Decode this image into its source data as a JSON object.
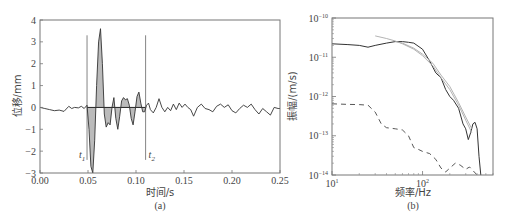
{
  "chart_data": [
    {
      "type": "line",
      "panel_label": "(a)",
      "title": "",
      "xlabel": "时间/s",
      "ylabel": "位移/mm",
      "xlim": [
        0.0,
        0.25
      ],
      "ylim": [
        -3,
        4
      ],
      "xticks": [
        "0.00",
        "0.05",
        "0.10",
        "0.15",
        "0.20",
        "0.25"
      ],
      "yticks": [
        "4",
        "3",
        "2",
        "1",
        "0",
        "-1",
        "-2",
        "-3"
      ],
      "grid": false,
      "annotations": [
        {
          "text": "t1",
          "x": 0.049,
          "y": -2.3
        },
        {
          "text": "t2",
          "x": 0.11,
          "y": -2.3
        }
      ],
      "markers": [
        {
          "name": "t1",
          "x": 0.049,
          "y_from": -2.4,
          "y_to": 3.3
        },
        {
          "name": "t2",
          "x": 0.11,
          "y_from": -2.4,
          "y_to": 3.3
        }
      ],
      "shaded_window": [
        0.049,
        0.11
      ],
      "series": [
        {
          "name": "displacement",
          "x": [
            0.0,
            0.005,
            0.01,
            0.015,
            0.02,
            0.025,
            0.03,
            0.033,
            0.036,
            0.04,
            0.043,
            0.046,
            0.049,
            0.051,
            0.053,
            0.055,
            0.057,
            0.059,
            0.061,
            0.063,
            0.065,
            0.067,
            0.069,
            0.071,
            0.073,
            0.075,
            0.077,
            0.079,
            0.081,
            0.083,
            0.085,
            0.087,
            0.089,
            0.091,
            0.093,
            0.095,
            0.097,
            0.099,
            0.101,
            0.103,
            0.105,
            0.107,
            0.109,
            0.111,
            0.113,
            0.115,
            0.118,
            0.121,
            0.124,
            0.127,
            0.13,
            0.133,
            0.136,
            0.139,
            0.142,
            0.145,
            0.148,
            0.151,
            0.154,
            0.157,
            0.16,
            0.164,
            0.168,
            0.172,
            0.176,
            0.18,
            0.184,
            0.188,
            0.192,
            0.196,
            0.2,
            0.204,
            0.208,
            0.212,
            0.216,
            0.22,
            0.224,
            0.228,
            0.232,
            0.236,
            0.24,
            0.244,
            0.248,
            0.25
          ],
          "y": [
            0.0,
            -0.05,
            -0.1,
            -0.15,
            -0.12,
            -0.18,
            0.05,
            -0.05,
            0.0,
            -0.02,
            0.05,
            -0.05,
            0.1,
            -1.0,
            -2.7,
            -3.0,
            -1.5,
            1.0,
            3.0,
            3.6,
            2.0,
            -0.3,
            -0.9,
            -0.7,
            -0.8,
            0.0,
            0.45,
            -0.5,
            -1.0,
            -0.4,
            0.3,
            0.45,
            0.35,
            0.4,
            0.1,
            -0.5,
            -0.8,
            -0.2,
            0.5,
            0.7,
            0.2,
            -0.2,
            -0.2,
            0.1,
            0.2,
            -0.1,
            -0.25,
            0.0,
            0.4,
            0.0,
            -0.2,
            0.0,
            -0.15,
            0.15,
            -0.1,
            0.2,
            0.0,
            0.15,
            0.0,
            -0.1,
            -0.4,
            0.0,
            0.15,
            -0.05,
            -0.1,
            -0.2,
            0.05,
            0.15,
            0.0,
            0.12,
            -0.15,
            -0.25,
            -0.05,
            0.1,
            0.0,
            0.15,
            -0.1,
            -0.3,
            -0.05,
            -0.2,
            -0.35,
            0.0,
            -0.05,
            -0.05
          ]
        }
      ]
    },
    {
      "type": "line",
      "panel_label": "(b)",
      "title": "",
      "xlabel": "频率/Hz",
      "ylabel": "振幅/(m/s)",
      "xscale": "log",
      "yscale": "log",
      "xlim": [
        10,
        600
      ],
      "ylim": [
        1e-14,
        1e-10
      ],
      "xticks": [
        "10^1",
        "10^2"
      ],
      "yticks": [
        "10^-10",
        "10^-11",
        "10^-12",
        "10^-13",
        "10^-14"
      ],
      "grid": false,
      "series": [
        {
          "name": "signal spectrum (solid dark)",
          "style": "solid",
          "x": [
            10,
            15,
            20,
            25,
            30,
            40,
            50,
            60,
            70,
            80,
            100,
            120,
            140,
            160,
            180,
            200,
            220,
            250,
            280,
            300,
            320,
            340,
            360,
            380,
            400,
            420,
            440
          ],
          "y": [
            2.2e-11,
            2.1e-11,
            2e-11,
            1.8e-11,
            2e-11,
            2.3e-11,
            2.5e-11,
            2.5e-11,
            2.4e-11,
            2.3e-11,
            1.6e-11,
            8e-12,
            4e-12,
            3e-12,
            1.5e-12,
            1e-12,
            8e-13,
            5e-13,
            2e-13,
            1.5e-13,
            8e-14,
            1.2e-13,
            2e-13,
            2.2e-13,
            1.5e-13,
            3e-14,
            1e-14
          ]
        },
        {
          "name": "model fit 1 (solid light)",
          "style": "solid-light",
          "x": [
            30,
            40,
            50,
            60,
            80,
            100,
            130,
            160,
            200,
            250,
            300,
            350
          ],
          "y": [
            3.5e-11,
            3e-11,
            2.6e-11,
            2.2e-11,
            1.6e-11,
            1.1e-11,
            6e-12,
            3e-12,
            1.5e-12,
            6e-13,
            2.5e-13,
            1.2e-13
          ]
        },
        {
          "name": "model fit 2 (solid light)",
          "style": "solid-light",
          "x": [
            50,
            60,
            80,
            100,
            130,
            160,
            200,
            250,
            300,
            350
          ],
          "y": [
            2.5e-11,
            2.3e-11,
            1.7e-11,
            1.2e-11,
            7e-12,
            3.5e-12,
            1.8e-12,
            7e-13,
            3e-13,
            1.5e-13
          ]
        },
        {
          "name": "noise spectrum (dashed)",
          "style": "dashed",
          "x": [
            10,
            15,
            20,
            25,
            30,
            35,
            40,
            50,
            60,
            70,
            80,
            90,
            100,
            120,
            140,
            160,
            180,
            200,
            230,
            260,
            300,
            330,
            360,
            400
          ],
          "y": [
            6.5e-13,
            6.3e-13,
            6.2e-13,
            6e-13,
            4e-13,
            2e-13,
            1.6e-13,
            1.5e-13,
            1.4e-13,
            1e-13,
            5e-14,
            4.5e-14,
            4e-14,
            3.5e-14,
            2.5e-14,
            1.5e-14,
            1.2e-14,
            1.5e-14,
            2e-14,
            1.8e-14,
            1.4e-14,
            1.6e-14,
            1.3e-14,
            1e-14
          ]
        }
      ]
    }
  ],
  "figure": {
    "panel_a": {
      "ylabel": "位移/mm",
      "xlabel": "时间/s",
      "caption": "(a)",
      "t1_label": "t",
      "t1_sub": "1",
      "t2_label": "t",
      "t2_sub": "2",
      "xticks": [
        "0.00",
        "0.05",
        "0.10",
        "0.15",
        "0.20",
        "0.25"
      ],
      "yticks": [
        "4",
        "3",
        "2",
        "1",
        "0",
        "−1",
        "−2",
        "−3"
      ]
    },
    "panel_b": {
      "ylabel": "振幅/(m/s)",
      "xlabel": "频率/Hz",
      "caption": "(b)",
      "ytick_base": "10",
      "yticks_exp": [
        "−10",
        "−11",
        "−12",
        "−13",
        "−14"
      ],
      "xticks_exp": [
        "1",
        "2"
      ]
    },
    "colors": {
      "frame": "#777777",
      "signal": "#333333",
      "fit": "#aaaaaa",
      "fill": "#bbbbbb",
      "dashed": "#444444"
    }
  }
}
